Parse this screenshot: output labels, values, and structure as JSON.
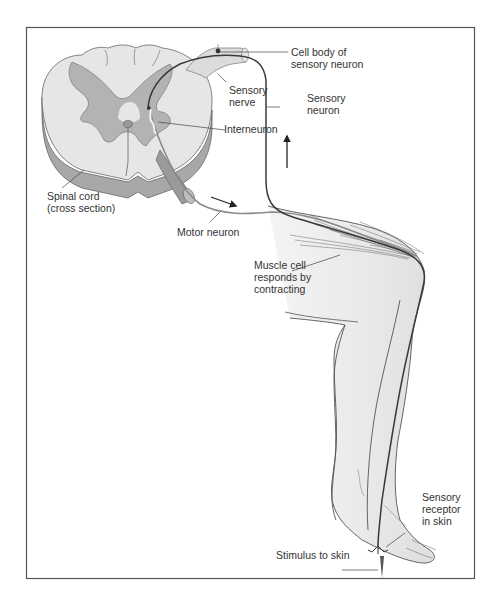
{
  "diagram": {
    "colors": {
      "frame": "#555555",
      "cord_white_matter": "#e6e6e6",
      "cord_gray_matter": "#b3b3b3",
      "cord_side": "#9a9a9a",
      "nerve": "#dcdcdc",
      "sensory_neuron": "#3a3a3a",
      "motor_neuron": "#8a8a8a",
      "leg_skin": "#eeeeee",
      "leg_outline": "#555555",
      "label_text": "#333333"
    },
    "labels": {
      "cell_body_line1": "Cell body of",
      "cell_body_line2": "sensory neuron",
      "sensory_nerve_line1": "Sensory",
      "sensory_nerve_line2": "nerve",
      "sensory_neuron_line1": "Sensory",
      "sensory_neuron_line2": "neuron",
      "interneuron": "Interneuron",
      "spinal_cord_line1": "Spinal cord",
      "spinal_cord_line2": "(cross section)",
      "motor_neuron": "Motor neuron",
      "muscle_line1": "Muscle cell",
      "muscle_line2": "responds by",
      "muscle_line3": "contracting",
      "receptor_line1": "Sensory",
      "receptor_line2": "receptor",
      "receptor_line3": "in skin",
      "stimulus": "Stimulus to skin"
    },
    "arrows": [
      {
        "name": "sensory-signal-direction",
        "direction": "up"
      },
      {
        "name": "motor-signal-direction",
        "direction": "down-right"
      }
    ]
  }
}
